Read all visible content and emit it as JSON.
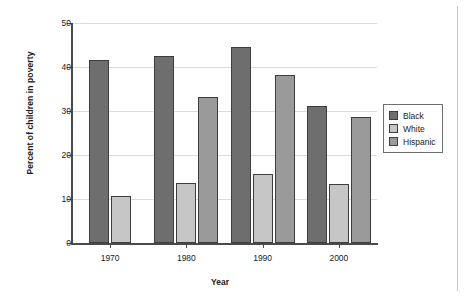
{
  "chart_data": {
    "type": "bar",
    "title": "",
    "xlabel": "Year",
    "ylabel": "Percent of children in poverty",
    "categories": [
      "1970",
      "1980",
      "1990",
      "2000"
    ],
    "series": [
      {
        "name": "Black",
        "color": "#6e6e6e",
        "values": [
          41.5,
          42.4,
          44.6,
          31.2
        ]
      },
      {
        "name": "White",
        "color": "#c6c6c6",
        "values": [
          10.7,
          13.7,
          15.7,
          13.4
        ]
      },
      {
        "name": "Hispanic",
        "color": "#9a9a9a",
        "values": [
          null,
          33.1,
          38.1,
          28.6
        ]
      }
    ],
    "ylim": [
      0,
      50
    ],
    "yticks": [
      "0",
      "10",
      "20",
      "30",
      "40",
      "50"
    ],
    "ytick_values": [
      0,
      10,
      20,
      30,
      40,
      50
    ],
    "grid": true,
    "legend_position": "right"
  }
}
